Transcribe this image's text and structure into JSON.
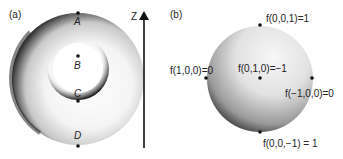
{
  "panel_a": {
    "label": "(a)",
    "axis_label": "Z",
    "points": [
      {
        "id": "A",
        "label": "A"
      },
      {
        "id": "B",
        "label": "B"
      },
      {
        "id": "C",
        "label": "C"
      },
      {
        "id": "D",
        "label": "D"
      }
    ]
  },
  "panel_b": {
    "label": "(b)",
    "points": [
      {
        "id": "top",
        "label": "f(0,0,1)=1"
      },
      {
        "id": "left",
        "label": "f(1,0,0)=0"
      },
      {
        "id": "center",
        "label": "f(0,1,0)=−1"
      },
      {
        "id": "right",
        "label": "f(−1,0,0)=0"
      },
      {
        "id": "bottom",
        "label": "f(0,0,−1) = 1"
      }
    ]
  },
  "colors": {
    "dark": "#1a1a1a",
    "light": "#f2f2f2",
    "background": "#ffffff"
  }
}
